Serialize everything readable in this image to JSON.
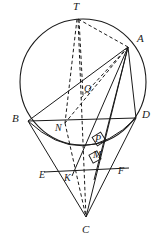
{
  "figure": {
    "width": 164,
    "height": 242,
    "background_color": "#ffffff",
    "stroke_color": "#1a1a1a",
    "label_color": "#1a1a1a"
  },
  "circle": {
    "name": "main-circle",
    "cx": 83,
    "cy": 82,
    "r": 63,
    "stroke_width": 1.1,
    "style": "solid"
  },
  "points": [
    {
      "id": "T",
      "label": "T",
      "x": 78,
      "y": 19,
      "label_x": 73,
      "label_y": 2,
      "on_circle": true
    },
    {
      "id": "A",
      "label": "A",
      "x": 128,
      "y": 47,
      "label_x": 136,
      "label_y": 34,
      "on_circle": true
    },
    {
      "id": "B",
      "label": "B",
      "x": 28,
      "y": 121,
      "label_x": 13,
      "label_y": 114,
      "on_circle": true
    },
    {
      "id": "D",
      "label": "D",
      "x": 136,
      "y": 118,
      "label_x": 143,
      "label_y": 110,
      "on_circle": true
    },
    {
      "id": "C",
      "label": "C",
      "x": 86,
      "y": 217,
      "label_x": 82,
      "label_y": 225,
      "on_circle": false
    },
    {
      "id": "Q",
      "label": "Q",
      "x": 83,
      "y": 95,
      "label_x": 85,
      "label_y": 84,
      "on_circle": false
    },
    {
      "id": "N",
      "label": "N",
      "x": 65,
      "y": 123,
      "label_x": 57,
      "label_y": 124,
      "on_circle": false
    },
    {
      "id": "P",
      "label": "P",
      "x": 99,
      "y": 144,
      "label_x": 95,
      "label_y": 134,
      "on_circle": false
    },
    {
      "id": "M",
      "label": "M",
      "x": 96,
      "y": 160,
      "label_x": 93,
      "label_y": 151,
      "on_circle": false
    },
    {
      "id": "K",
      "label": "K",
      "x": 72,
      "y": 172,
      "label_x": 65,
      "label_y": 172,
      "on_circle": false
    },
    {
      "id": "E",
      "label": "E",
      "x": 50,
      "y": 172,
      "label_x": 40,
      "label_y": 170,
      "on_circle": false
    },
    {
      "id": "F",
      "label": "F",
      "x": 120,
      "y": 170,
      "label_x": 119,
      "label_y": 166,
      "on_circle": false
    }
  ],
  "solid_segments": [
    {
      "name": "segment-B-D",
      "from": "B",
      "to": "D"
    },
    {
      "name": "segment-B-A",
      "from": "B",
      "to": "A"
    },
    {
      "name": "segment-B-C",
      "from": "B",
      "to": "C"
    },
    {
      "name": "segment-D-C",
      "from": "D",
      "to": "C"
    },
    {
      "name": "segment-A-D",
      "from": "A",
      "to": "D"
    },
    {
      "name": "segment-A-C",
      "from": "A",
      "to": "C"
    },
    {
      "name": "segment-A-K",
      "from": "A",
      "to": "K"
    },
    {
      "name": "segment-A-M",
      "from": "A",
      "to": "M"
    },
    {
      "name": "segment-E-F",
      "from": "E",
      "to": "F"
    }
  ],
  "dashed_segments": [
    {
      "name": "segment-T-A",
      "from": "T",
      "to": "A"
    },
    {
      "name": "segment-T-C",
      "from": "T",
      "to": "C"
    },
    {
      "name": "segment-T-N",
      "from": "T",
      "to": "N"
    },
    {
      "name": "segment-N-C",
      "from": "N",
      "to": "C"
    },
    {
      "name": "segment-A-Q",
      "from": "A",
      "to": "Q"
    },
    {
      "name": "segment-A-N",
      "from": "A",
      "to": "N"
    },
    {
      "name": "segment-Q-T",
      "from": "Q",
      "to": "T"
    }
  ],
  "right_angle_marks": [
    {
      "name": "right-angle-at-P",
      "cx": 99,
      "cy": 139,
      "size": 9,
      "rotation": -32
    },
    {
      "name": "right-angle-at-M",
      "cx": 95,
      "cy": 156,
      "size": 8,
      "rotation": -28
    }
  ],
  "arcs": [
    {
      "name": "lower-ellipse-arc",
      "description": "base ellipse arc of cone from B to D passing below BD"
    }
  ]
}
